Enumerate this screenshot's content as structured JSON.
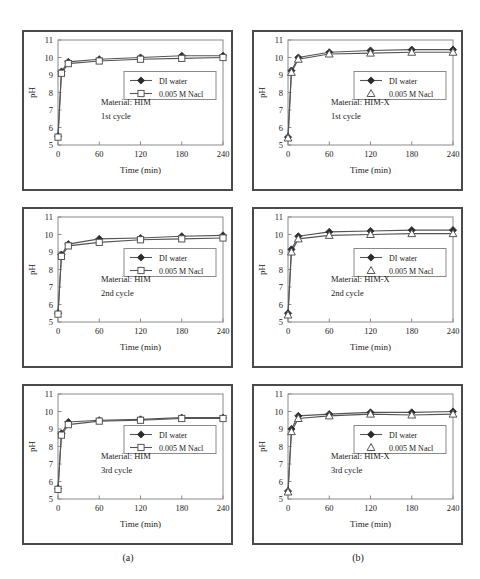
{
  "figure": {
    "panel_count": 6,
    "column_labels": [
      {
        "name": "col-a",
        "text": "(a)"
      },
      {
        "name": "col-b",
        "text": "(b)"
      }
    ]
  },
  "chart_data": [
    {
      "id": "him-1st",
      "type": "line",
      "title": "",
      "xlabel": "Time (min)",
      "ylabel": "pH",
      "xlim": [
        0,
        240
      ],
      "ylim": [
        5,
        11
      ],
      "xticks": [
        0,
        60,
        120,
        180,
        240
      ],
      "yticks": [
        5,
        6,
        7,
        8,
        9,
        10,
        11
      ],
      "grid": false,
      "legend_position": "center",
      "annotations": [
        "Material: HIM",
        "1st cycle"
      ],
      "x": [
        0,
        5,
        15,
        60,
        120,
        180,
        240
      ],
      "series": [
        {
          "name": "DI water",
          "marker": "filled-diamond",
          "values": [
            5.5,
            9.2,
            9.75,
            9.9,
            10.0,
            10.1,
            10.1
          ]
        },
        {
          "name": "0.005 M Nacl",
          "marker": "open-square",
          "values": [
            5.45,
            9.1,
            9.65,
            9.8,
            9.9,
            9.95,
            10.0
          ]
        }
      ]
    },
    {
      "id": "himx-1st",
      "type": "line",
      "title": "",
      "xlabel": "Time (min)",
      "ylabel": "pH",
      "xlim": [
        0,
        240
      ],
      "ylim": [
        5,
        11
      ],
      "xticks": [
        0,
        60,
        120,
        180,
        240
      ],
      "yticks": [
        5,
        6,
        7,
        8,
        9,
        10,
        11
      ],
      "grid": false,
      "legend_position": "center",
      "annotations": [
        "Material: HIM-X",
        "1st cycle"
      ],
      "x": [
        0,
        5,
        15,
        60,
        120,
        180,
        240
      ],
      "series": [
        {
          "name": "DI water",
          "marker": "filled-diamond",
          "values": [
            5.45,
            9.25,
            10.0,
            10.3,
            10.4,
            10.45,
            10.45
          ]
        },
        {
          "name": "0.005 M Nacl",
          "marker": "open-triangle",
          "values": [
            5.4,
            9.15,
            9.9,
            10.2,
            10.25,
            10.3,
            10.3
          ]
        }
      ]
    },
    {
      "id": "him-2nd",
      "type": "line",
      "title": "",
      "xlabel": "Time (min)",
      "ylabel": "pH",
      "xlim": [
        0,
        240
      ],
      "ylim": [
        5,
        11
      ],
      "xticks": [
        0,
        60,
        120,
        180,
        240
      ],
      "yticks": [
        5,
        6,
        7,
        8,
        9,
        10,
        11
      ],
      "grid": false,
      "legend_position": "center",
      "annotations": [
        "Material: HIM",
        "2nd cycle"
      ],
      "x": [
        0,
        5,
        15,
        60,
        120,
        180,
        240
      ],
      "series": [
        {
          "name": "DI water",
          "marker": "filled-diamond",
          "values": [
            5.5,
            8.85,
            9.45,
            9.75,
            9.8,
            9.9,
            9.95
          ]
        },
        {
          "name": "0.005 M Nacl",
          "marker": "open-square",
          "values": [
            5.45,
            8.75,
            9.35,
            9.55,
            9.7,
            9.75,
            9.8
          ]
        }
      ]
    },
    {
      "id": "himx-2nd",
      "type": "line",
      "title": "",
      "xlabel": "Time (min)",
      "ylabel": "pH",
      "xlim": [
        0,
        240
      ],
      "ylim": [
        5,
        11
      ],
      "xticks": [
        0,
        60,
        120,
        180,
        240
      ],
      "yticks": [
        5,
        6,
        7,
        8,
        9,
        10,
        11
      ],
      "grid": false,
      "legend_position": "center",
      "annotations": [
        "Material: HIM-X",
        "2nd cycle"
      ],
      "x": [
        0,
        5,
        15,
        60,
        120,
        180,
        240
      ],
      "series": [
        {
          "name": "DI water",
          "marker": "filled-diamond",
          "values": [
            5.5,
            9.15,
            9.9,
            10.15,
            10.2,
            10.25,
            10.25
          ]
        },
        {
          "name": "0.005 M Nacl",
          "marker": "open-triangle",
          "values": [
            5.4,
            9.0,
            9.75,
            9.95,
            10.0,
            10.05,
            10.05
          ]
        }
      ]
    },
    {
      "id": "him-3rd",
      "type": "line",
      "title": "",
      "xlabel": "Time (min)",
      "ylabel": "pH",
      "xlim": [
        0,
        240
      ],
      "ylim": [
        5,
        11
      ],
      "xticks": [
        0,
        60,
        120,
        180,
        240
      ],
      "yticks": [
        5,
        6,
        7,
        8,
        9,
        10,
        11
      ],
      "grid": false,
      "legend_position": "center",
      "annotations": [
        "Material: HIM",
        "3rd cycle"
      ],
      "x": [
        0,
        5,
        15,
        60,
        120,
        180,
        240
      ],
      "series": [
        {
          "name": "DI water",
          "marker": "filled-diamond",
          "values": [
            5.6,
            8.75,
            9.4,
            9.5,
            9.55,
            9.65,
            9.65
          ]
        },
        {
          "name": "0.005 M Nacl",
          "marker": "open-square",
          "values": [
            5.55,
            8.65,
            9.25,
            9.45,
            9.5,
            9.6,
            9.6
          ]
        }
      ]
    },
    {
      "id": "himx-3rd",
      "type": "line",
      "title": "",
      "xlabel": "Time (min)",
      "ylabel": "pH",
      "xlim": [
        0,
        240
      ],
      "ylim": [
        5,
        11
      ],
      "xticks": [
        0,
        60,
        120,
        180,
        240
      ],
      "yticks": [
        5,
        6,
        7,
        8,
        9,
        10,
        11
      ],
      "grid": false,
      "legend_position": "center",
      "annotations": [
        "Material: HIM-X",
        "3rd cycle"
      ],
      "x": [
        0,
        5,
        15,
        60,
        120,
        180,
        240
      ],
      "series": [
        {
          "name": "DI water",
          "marker": "filled-diamond",
          "values": [
            5.45,
            9.0,
            9.75,
            9.85,
            9.95,
            9.95,
            10.0
          ]
        },
        {
          "name": "0.005 M Nacl",
          "marker": "open-triangle",
          "values": [
            5.4,
            8.85,
            9.6,
            9.75,
            9.85,
            9.8,
            9.85
          ]
        }
      ]
    }
  ],
  "colors": {
    "panel_border": "#4a4a4a",
    "axis": "#8a8a8a",
    "series_line": "#555555",
    "marker_fill_dark": "#2b2b2b",
    "marker_fill_light": "#ffffff",
    "text": "#1a1a1a",
    "background": "#ffffff"
  }
}
